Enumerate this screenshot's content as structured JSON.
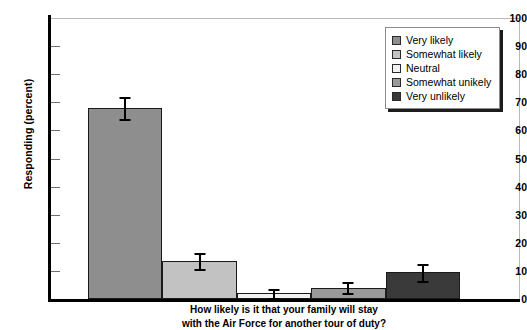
{
  "chart_data": {
    "type": "bar",
    "title": "",
    "subtitle": "",
    "xlabel": "How likely is it that your family will stay with the Air Force for another tour of duty?",
    "ylabel": "Responding (percent)",
    "ylim": [
      0,
      100
    ],
    "ytick_labels": [
      "100",
      "90",
      "80",
      "70",
      "60",
      "50",
      "40",
      "30",
      "20",
      "10",
      "0"
    ],
    "ytick_values": [
      100,
      90,
      80,
      70,
      60,
      50,
      40,
      30,
      20,
      10,
      0
    ],
    "grid": false,
    "legend_position": "top-right",
    "categories": [
      "Very likely",
      "Somewhat likely",
      "Neutral",
      "Somewhat unikely",
      "Very unlikely"
    ],
    "values": [
      68,
      13.7,
      2,
      4,
      9.5
    ],
    "errors_low": [
      64,
      10.8,
      0.5,
      2,
      6.5
    ],
    "errors_high": [
      72,
      16.3,
      3.5,
      6,
      12.5
    ],
    "bar_colors": [
      "#8e8e8e",
      "#c2c2c2",
      "#f2f2f2",
      "#9a9a9a",
      "#3a3a3a"
    ],
    "bar_edge_color": "#1a1a1a",
    "axis_color": "#000000",
    "frame_color": "#b9b9b9"
  },
  "axis": {
    "y_title": "Responding (percent)",
    "ticks": [
      {
        "label": "100",
        "value": 100
      },
      {
        "label": "90",
        "value": 90
      },
      {
        "label": "80",
        "value": 80
      },
      {
        "label": "70",
        "value": 70
      },
      {
        "label": "60",
        "value": 60
      },
      {
        "label": "50",
        "value": 50
      },
      {
        "label": "40",
        "value": 40
      },
      {
        "label": "30",
        "value": 30
      },
      {
        "label": "20",
        "value": 20
      },
      {
        "label": "10",
        "value": 10
      },
      {
        "label": "0",
        "value": 0
      }
    ]
  },
  "caption": {
    "line1": "How likely is it that your family will stay",
    "line2": "with the Air Force for another tour of duty?"
  },
  "legend": {
    "items": [
      {
        "label": "Very likely",
        "color": "#8e8e8e"
      },
      {
        "label": "Somewhat likely",
        "color": "#c2c2c2"
      },
      {
        "label": "Neutral",
        "color": "#f2f2f2"
      },
      {
        "label": "Somewhat unikely",
        "color": "#9a9a9a"
      },
      {
        "label": "Very unlikely",
        "color": "#3a3a3a"
      }
    ]
  }
}
